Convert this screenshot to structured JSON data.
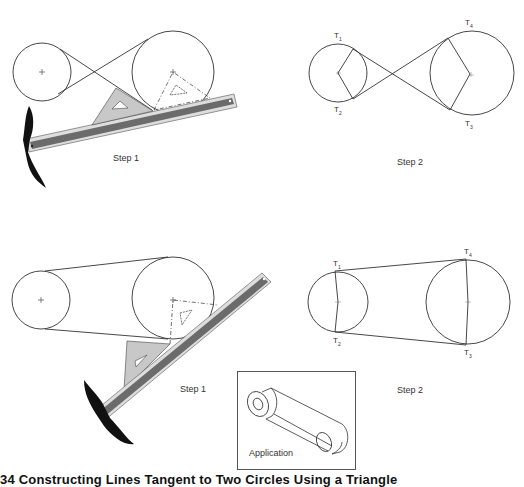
{
  "figure": {
    "top_row": {
      "step1_label": "Step 1",
      "step2_label": "Step 2",
      "tangent_points": {
        "t1": "T",
        "t1_sub": "1",
        "t2": "T",
        "t2_sub": "2",
        "t3": "T",
        "t3_sub": "3",
        "t4": "T",
        "t4_sub": "4"
      },
      "belt_type": "crossed"
    },
    "bottom_row": {
      "step1_label": "Step 1",
      "step2_label": "Step 2",
      "tangent_points": {
        "t1": "T",
        "t1_sub": "1",
        "t2": "T",
        "t2_sub": "2",
        "t3": "T",
        "t3_sub": "3",
        "t4": "T",
        "t4_sub": "4"
      },
      "belt_type": "open"
    },
    "application": {
      "label": "Application"
    },
    "caption": "34  Constructing Lines Tangent to Two Circles  Using a Triangle"
  },
  "colors": {
    "line": "#333333",
    "blade": "#6b6b6b",
    "triangle": "#c8c8c8",
    "head": "#111111"
  }
}
